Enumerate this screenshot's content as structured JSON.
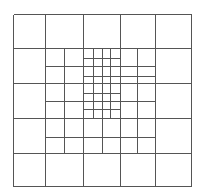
{
  "diagram": {
    "title": "",
    "stroke_color": "#555555",
    "background": "#ffffff",
    "bounds": {
      "x0": 13,
      "y0": 14,
      "x1": 191,
      "y1": 186
    },
    "lines": [
      {
        "x1": 13,
        "y1": 14,
        "x2": 191,
        "y2": 14
      },
      {
        "x1": 13,
        "y1": 48,
        "x2": 191,
        "y2": 48
      },
      {
        "x1": 13,
        "y1": 83,
        "x2": 191,
        "y2": 83
      },
      {
        "x1": 13,
        "y1": 118,
        "x2": 191,
        "y2": 118
      },
      {
        "x1": 13,
        "y1": 153,
        "x2": 191,
        "y2": 153
      },
      {
        "x1": 13,
        "y1": 186,
        "x2": 191,
        "y2": 186
      },
      {
        "x1": 13,
        "y1": 14,
        "x2": 13,
        "y2": 186
      },
      {
        "x1": 45,
        "y1": 14,
        "x2": 45,
        "y2": 186
      },
      {
        "x1": 83,
        "y1": 14,
        "x2": 83,
        "y2": 186
      },
      {
        "x1": 120,
        "y1": 14,
        "x2": 120,
        "y2": 186
      },
      {
        "x1": 155,
        "y1": 14,
        "x2": 155,
        "y2": 186
      },
      {
        "x1": 191,
        "y1": 14,
        "x2": 191,
        "y2": 186
      },
      {
        "x1": 64,
        "y1": 48,
        "x2": 64,
        "y2": 153
      },
      {
        "x1": 137,
        "y1": 48,
        "x2": 137,
        "y2": 153
      },
      {
        "x1": 102,
        "y1": 48,
        "x2": 102,
        "y2": 153
      },
      {
        "x1": 45,
        "y1": 66,
        "x2": 155,
        "y2": 66
      },
      {
        "x1": 45,
        "y1": 101,
        "x2": 155,
        "y2": 101
      },
      {
        "x1": 45,
        "y1": 137,
        "x2": 155,
        "y2": 137
      },
      {
        "x1": 93,
        "y1": 48,
        "x2": 93,
        "y2": 118
      },
      {
        "x1": 110,
        "y1": 48,
        "x2": 110,
        "y2": 118
      },
      {
        "x1": 83,
        "y1": 58,
        "x2": 120,
        "y2": 58
      },
      {
        "x1": 83,
        "y1": 76,
        "x2": 155,
        "y2": 76
      },
      {
        "x1": 83,
        "y1": 93,
        "x2": 120,
        "y2": 93
      },
      {
        "x1": 83,
        "y1": 109,
        "x2": 120,
        "y2": 109
      }
    ]
  }
}
